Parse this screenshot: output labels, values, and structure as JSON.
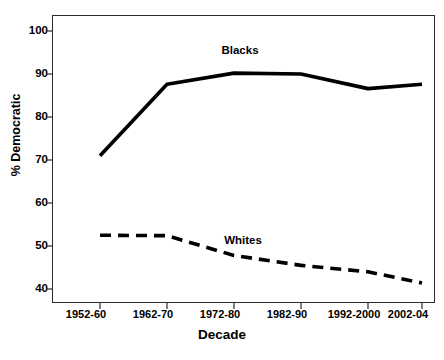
{
  "chart_data": {
    "type": "line",
    "title": "",
    "xlabel": "Decade",
    "ylabel": "% Democratic",
    "categories": [
      "1952-60",
      "1962-70",
      "1972-80",
      "1982-90",
      "1992-2000",
      "2002-04"
    ],
    "series": [
      {
        "name": "Blacks",
        "style": "solid",
        "color": "#000000",
        "values": [
          71.0,
          87.6,
          90.2,
          90.0,
          86.6,
          87.6
        ]
      },
      {
        "name": "Whites",
        "style": "dashed",
        "color": "#000000",
        "values": [
          52.5,
          52.4,
          47.8,
          45.5,
          44.0,
          41.4
        ]
      }
    ],
    "ylim": [
      36,
      103
    ],
    "yticks": [
      40,
      50,
      60,
      70,
      80,
      90,
      100
    ],
    "ytick_labels": [
      "40",
      "50",
      "60",
      "70",
      "80",
      "90",
      "100"
    ],
    "grid": false,
    "legend_position": "inline-annotations",
    "frame": true
  },
  "axes": {
    "x_title": "Decade",
    "y_title": "% Democratic"
  },
  "annotations": [
    {
      "name": "blacks",
      "text": "Blacks"
    },
    {
      "name": "whites",
      "text": "Whites"
    }
  ]
}
